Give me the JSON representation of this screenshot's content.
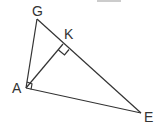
{
  "diagram": {
    "type": "geometry",
    "points": {
      "G": {
        "label": "G",
        "x": 37,
        "y": 19,
        "lx": 32,
        "ly": 16
      },
      "K": {
        "label": "K",
        "x": 63,
        "y": 44,
        "lx": 64,
        "ly": 39
      },
      "A": {
        "label": "A",
        "x": 26,
        "y": 88,
        "lx": 12,
        "ly": 93
      },
      "E": {
        "label": "E",
        "x": 141,
        "y": 113,
        "lx": 144,
        "ly": 122
      }
    },
    "segments": [
      [
        "G",
        "A"
      ],
      [
        "G",
        "E"
      ],
      [
        "A",
        "E"
      ],
      [
        "A",
        "K"
      ]
    ],
    "right_angles": [
      "K",
      "A"
    ],
    "stroke_color": "#333333"
  }
}
